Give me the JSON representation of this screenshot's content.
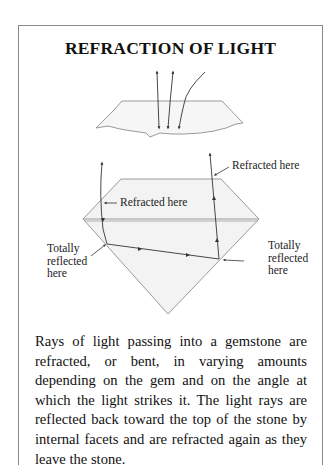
{
  "title": "REFRACTION OF LIGHT",
  "diagram": {
    "top_figure": {
      "description": "Light rays entering a gem surface and bending",
      "rays": 3
    },
    "gem_figure": {
      "description": "Cross section of a brilliant-cut gemstone showing light path",
      "labels": {
        "refracted_top_right": "Refracted here",
        "refracted_left": "Refracted here",
        "totally_reflected_left": [
          "Totally",
          "reflected",
          "here"
        ],
        "totally_reflected_right": [
          "Totally",
          "reflected",
          "here"
        ]
      }
    }
  },
  "caption": "Rays of light passing into a gemstone are refracted, or bent, in varying amounts depending on the gem and on the angle at which the light strikes it. The light rays are reflected back toward the top of the stone by internal facets and are refracted again as they leave the stone.",
  "caption_lines": [
    "Rays of light passing into a gemstone are re-",
    "fracted, or bent, in varying amounts depending on",
    "the gem and on the angle at which the light strikes",
    "it. The light rays are reflected back toward the top",
    "of the stone by internal facets and are refracted",
    "again as they leave the stone."
  ],
  "colors": {
    "frame": "#8a8a8a",
    "gem_outline": "#9a9a9a",
    "gem_fill": "#f4f4f4",
    "ray": "#333333"
  }
}
